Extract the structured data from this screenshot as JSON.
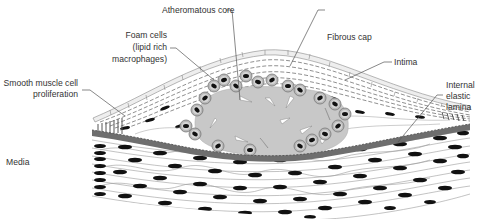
{
  "diagram": {
    "colors": {
      "background": "#ffffff",
      "core_fill": "#c8c8c8",
      "elastic_lamina": "#6e6e6e",
      "nuclei": "#111111",
      "cell_outline": "#8a8a8a",
      "endothelium_fill": "#eeeeee",
      "foam_cell_ring": "#9a9a9a",
      "label_text": "#333333",
      "leader_line": "#555555"
    },
    "labels": {
      "atheromatous_core": "Atheromatous core",
      "foam_cells_line1": "Foam cells",
      "foam_cells_line2": "(lipid rich",
      "foam_cells_line3": "macrophages)",
      "fibrous_cap": "Fibrous cap",
      "intima": "Intima",
      "smooth_muscle_line1": "Smooth muscle cell",
      "smooth_muscle_line2": "proliferation",
      "internal_elastic_line1": "Internal",
      "internal_elastic_line2": "elastic",
      "internal_elastic_line3": "lamina",
      "media": "Media"
    },
    "layers": [
      "Intima",
      "Fibrous cap",
      "Atheromatous core",
      "Internal elastic lamina",
      "Media"
    ]
  }
}
